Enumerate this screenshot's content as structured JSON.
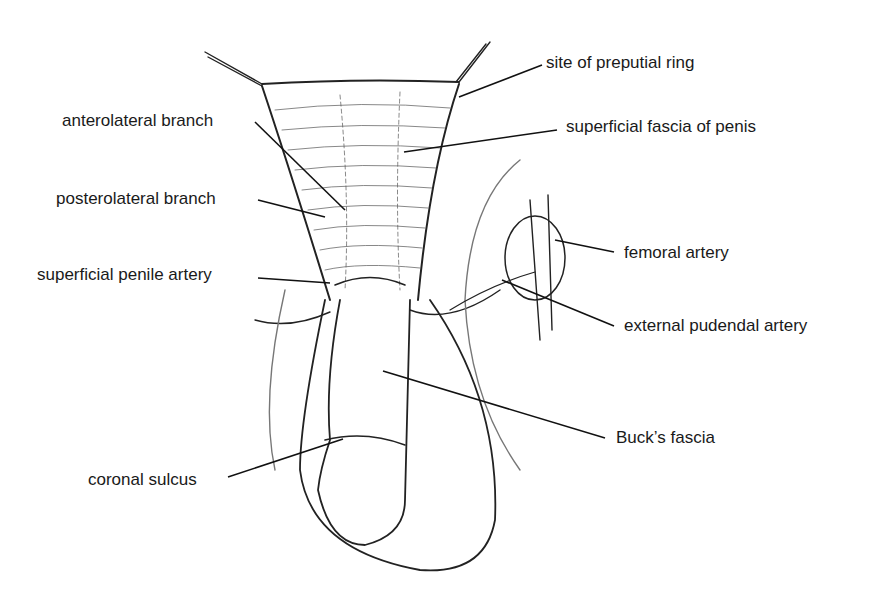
{
  "figure": {
    "labels": [
      {
        "id": "site-of-preputial-ring",
        "text": "site of preputial ring",
        "x": 546,
        "y": 53,
        "line": [
          542,
          65,
          459,
          97
        ]
      },
      {
        "id": "anterolateral-branch",
        "text": "anterolateral branch",
        "x": 62,
        "y": 111,
        "line": [
          255,
          122,
          345,
          210
        ]
      },
      {
        "id": "superficial-fascia-of-penis",
        "text": "superficial fascia of penis",
        "x": 566,
        "y": 117,
        "line": [
          557,
          130,
          404,
          152
        ]
      },
      {
        "id": "posterolateral-branch",
        "text": "posterolateral branch",
        "x": 56,
        "y": 189,
        "line": [
          258,
          200,
          325,
          217
        ]
      },
      {
        "id": "superficial-penile-artery",
        "text": "superficial penile artery",
        "x": 37,
        "y": 265,
        "line": [
          258,
          278,
          330,
          283
        ]
      },
      {
        "id": "femoral-artery",
        "text": "femoral artery",
        "x": 624,
        "y": 243,
        "line": [
          614,
          252,
          555,
          240
        ]
      },
      {
        "id": "external-pudendal-artery",
        "text": "external pudendal artery",
        "x": 624,
        "y": 316,
        "line": [
          614,
          326,
          502,
          280
        ]
      },
      {
        "id": "bucks-fascia",
        "text": "Buck’s fascia",
        "x": 616,
        "y": 428,
        "line": [
          605,
          438,
          383,
          371
        ]
      },
      {
        "id": "coronal-sulcus",
        "text": "coronal sulcus",
        "x": 88,
        "y": 470,
        "line": [
          228,
          477,
          343,
          439
        ]
      }
    ]
  }
}
